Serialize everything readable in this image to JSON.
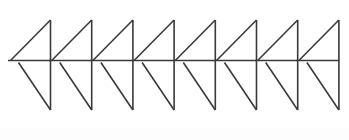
{
  "figure": {
    "canvas": {
      "width": 349,
      "height": 140,
      "background": "#ffffff"
    },
    "stroke": {
      "color": "#3a3a3a",
      "width": 1.6,
      "cap": "butt",
      "join": "miter"
    },
    "motif": {
      "name": "four-like-arrow-unit",
      "count": 8,
      "pitch": 41.2,
      "first_apex_x": 50.5,
      "geometry": {
        "apex_y": 20,
        "mid_y": 60.5,
        "base_y": 110,
        "upper_diagonal_left_x_offset": -40,
        "lower_left_x_offset": -32,
        "horizontal_left_x_offset": -42
      }
    },
    "bottom_band": {
      "color": "#fdfdfd",
      "height": 11
    },
    "elements": [
      {
        "name": "vertical-stroke",
        "count": 8
      },
      {
        "name": "upper-triangle-hypotenuse",
        "count": 8
      },
      {
        "name": "upper-horizontal-stub",
        "count": 8
      },
      {
        "name": "lower-triangle-top-edge",
        "count": 8
      },
      {
        "name": "lower-triangle-hypotenuse",
        "count": 8
      }
    ]
  },
  "chart_data": {
    "type": "line",
    "xlabel": "",
    "ylabel": "",
    "xlim": [
      0,
      349
    ],
    "ylim": [
      140,
      0
    ],
    "grid": false,
    "legend": "none",
    "annotations": [],
    "units": [
      {
        "index": 1,
        "apex": [
          50.5,
          20
        ],
        "base": [
          50.5,
          110
        ],
        "mid": [
          50.5,
          60.5
        ],
        "upper_diagonal_start": [
          10.5,
          60.5
        ],
        "upper_stub_start": [
          8.0,
          60.5
        ],
        "lower_left": [
          18.5,
          62.5
        ],
        "lower_top_left": [
          8.0,
          60.5
        ]
      },
      {
        "index": 2,
        "apex": [
          91.7,
          20
        ],
        "base": [
          91.7,
          110
        ],
        "mid": [
          91.7,
          60.5
        ],
        "upper_diagonal_start": [
          51.7,
          60.5
        ],
        "upper_stub_start": [
          49.3,
          60.5
        ],
        "lower_left": [
          59.7,
          62.5
        ],
        "lower_top_left": [
          49.3,
          60.5
        ]
      },
      {
        "index": 3,
        "apex": [
          132.9,
          20
        ],
        "base": [
          132.9,
          110
        ],
        "mid": [
          132.9,
          60.5
        ],
        "upper_diagonal_start": [
          92.9,
          60.5
        ],
        "upper_stub_start": [
          90.5,
          60.5
        ],
        "lower_left": [
          100.9,
          62.5
        ],
        "lower_top_left": [
          90.5,
          60.5
        ]
      },
      {
        "index": 4,
        "apex": [
          174.1,
          20
        ],
        "base": [
          174.1,
          110
        ],
        "mid": [
          174.1,
          60.5
        ],
        "upper_diagonal_start": [
          134.1,
          60.5
        ],
        "upper_stub_start": [
          131.7,
          60.5
        ],
        "lower_left": [
          142.1,
          62.5
        ],
        "lower_top_left": [
          131.7,
          60.5
        ]
      },
      {
        "index": 5,
        "apex": [
          215.3,
          20
        ],
        "base": [
          215.3,
          110
        ],
        "mid": [
          215.3,
          60.5
        ],
        "upper_diagonal_start": [
          175.3,
          60.5
        ],
        "upper_stub_start": [
          172.9,
          60.5
        ],
        "lower_left": [
          183.3,
          62.5
        ],
        "lower_top_left": [
          172.9,
          60.5
        ]
      },
      {
        "index": 6,
        "apex": [
          256.5,
          20
        ],
        "base": [
          256.5,
          110
        ],
        "mid": [
          256.5,
          60.5
        ],
        "upper_diagonal_start": [
          216.5,
          60.5
        ],
        "upper_stub_start": [
          214.1,
          60.5
        ],
        "lower_left": [
          224.5,
          62.5
        ],
        "lower_top_left": [
          214.1,
          60.5
        ]
      },
      {
        "index": 7,
        "apex": [
          297.7,
          20
        ],
        "base": [
          297.7,
          110
        ],
        "mid": [
          297.7,
          60.5
        ],
        "upper_diagonal_start": [
          257.7,
          60.5
        ],
        "upper_stub_start": [
          255.3,
          60.5
        ],
        "lower_left": [
          265.7,
          62.5
        ],
        "lower_top_left": [
          255.3,
          60.5
        ]
      },
      {
        "index": 8,
        "apex": [
          338.9,
          20
        ],
        "base": [
          338.9,
          110
        ],
        "mid": [
          338.9,
          60.5
        ],
        "upper_diagonal_start": [
          298.9,
          60.5
        ],
        "upper_stub_start": [
          296.5,
          60.5
        ],
        "lower_left": [
          306.9,
          62.5
        ],
        "lower_top_left": [
          296.5,
          60.5
        ]
      }
    ]
  }
}
